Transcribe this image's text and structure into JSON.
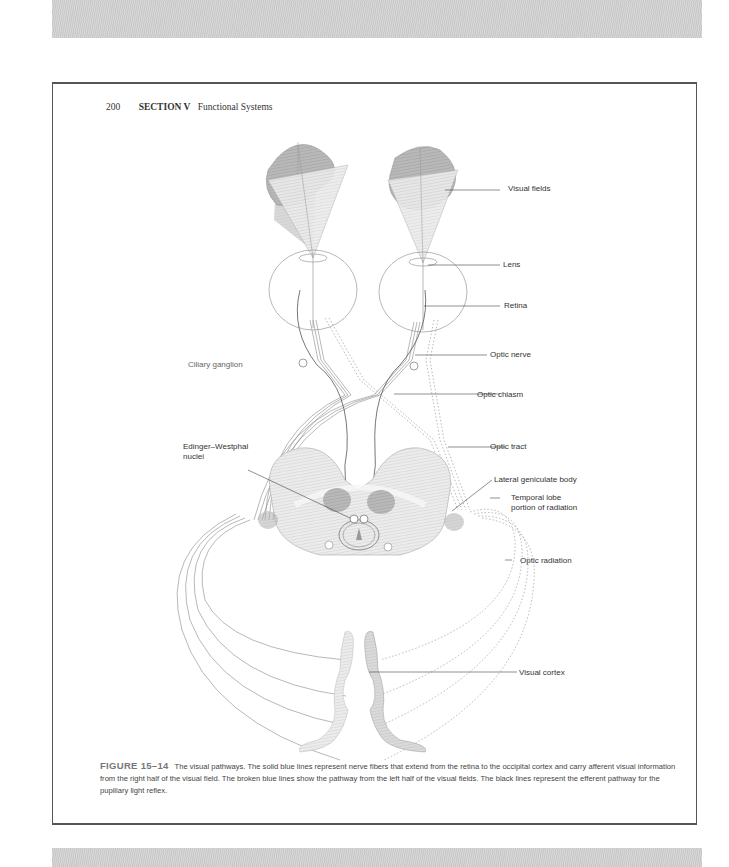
{
  "running_head": {
    "page_number": "200",
    "section": "SECTION V",
    "section_title": "Functional Systems"
  },
  "figure": {
    "labels": {
      "visual_fields": "Visual fields",
      "lens": "Lens",
      "retina": "Retina",
      "optic_nerve": "Optic nerve",
      "ciliary_ganglion": "Ciliary ganglion",
      "optic_chiasm": "Optic chiasm",
      "optic_tract": "Optic tract",
      "edinger_westphal_line1": "Edinger–Westphal",
      "edinger_westphal_line2": "nuclei",
      "lateral_geniculate_body": "Lateral geniculate body",
      "temporal_lobe_line1": "Temporal lobe",
      "temporal_lobe_line2": "portion of radiation",
      "optic_radiation": "Optic radiation",
      "visual_cortex": "Visual cortex"
    },
    "colors": {
      "light_fill": "#e4e4e4",
      "dark_fill": "#9a9a9a",
      "line": "#777777",
      "label_line": "#333333"
    }
  },
  "caption": {
    "figure_number": "FIGURE 15–14",
    "text": "The visual pathways. The solid blue lines represent nerve fibers that extend from the retina to the occipital cortex and carry afferent visual information from the right half of the visual field. The broken blue lines show the pathway from the left half of the visual fields. The black lines represent the efferent pathway for the pupillary light reflex."
  }
}
